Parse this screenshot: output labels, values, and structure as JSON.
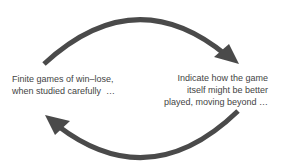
{
  "diagram": {
    "type": "cycle",
    "colors": {
      "arrow": "#4a4a4a",
      "text": "#444444",
      "background": "#ffffff"
    },
    "nodes": [
      {
        "id": "left",
        "lines": [
          "Finite games of win–lose,",
          "when studied carefully  …"
        ]
      },
      {
        "id": "right",
        "lines": [
          "Indicate how the game",
          "itself might be better",
          "played, moving beyond …"
        ]
      }
    ],
    "edges": [
      {
        "from": "left",
        "to": "right",
        "shape": "curved-arrow-top"
      },
      {
        "from": "right",
        "to": "left",
        "shape": "curved-arrow-bottom"
      }
    ]
  }
}
